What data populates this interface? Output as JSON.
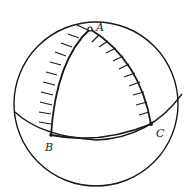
{
  "figure": {
    "labels": {
      "A": "A",
      "B": "B",
      "C": "C"
    },
    "colors": {
      "stroke": "#1a1a1a",
      "background": "#ffffff"
    }
  }
}
